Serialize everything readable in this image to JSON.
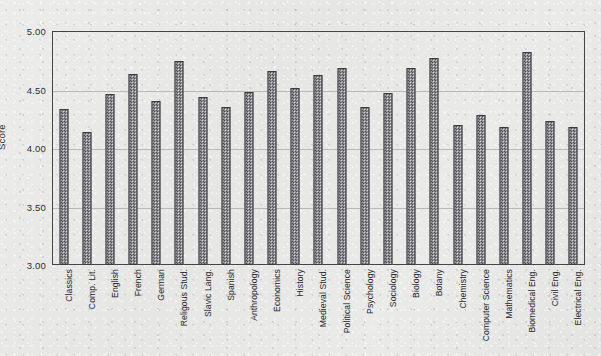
{
  "chart_data": {
    "type": "bar",
    "title": "",
    "xlabel": "",
    "ylabel": "Score",
    "ylim": [
      3.0,
      5.0
    ],
    "yticks": [
      "3.00",
      "3.50",
      "4.00",
      "4.50",
      "5.00"
    ],
    "ytick_values": [
      3.0,
      3.5,
      4.0,
      4.5,
      5.0
    ],
    "grid": "horizontal",
    "legend": "none",
    "bar_fill": "#8f8f94",
    "bar_edge": "#3b3b40",
    "frame_color": "#44444a",
    "background_color": "#e9e9e7",
    "categories": [
      "Classics",
      "Comp. Lit.",
      "English",
      "French",
      "German",
      "Religous Stud.",
      "Slavic Lang.",
      "Spanish",
      "Anthropology",
      "Economics",
      "History",
      "Medieval Stud.",
      "Political  Science",
      "Psychology",
      "Sociology",
      "Biology",
      "Botany",
      "Chemistry",
      "Computer Science",
      "Mathematics",
      "Biomedical Eng.",
      "Civil Eng.",
      "Electrical Eng."
    ],
    "values": [
      4.33,
      4.14,
      4.46,
      4.63,
      4.4,
      4.74,
      4.44,
      4.35,
      4.48,
      4.66,
      4.51,
      4.62,
      4.68,
      4.35,
      4.47,
      4.68,
      4.77,
      4.2,
      4.28,
      4.18,
      4.82,
      4.23,
      4.18
    ]
  }
}
